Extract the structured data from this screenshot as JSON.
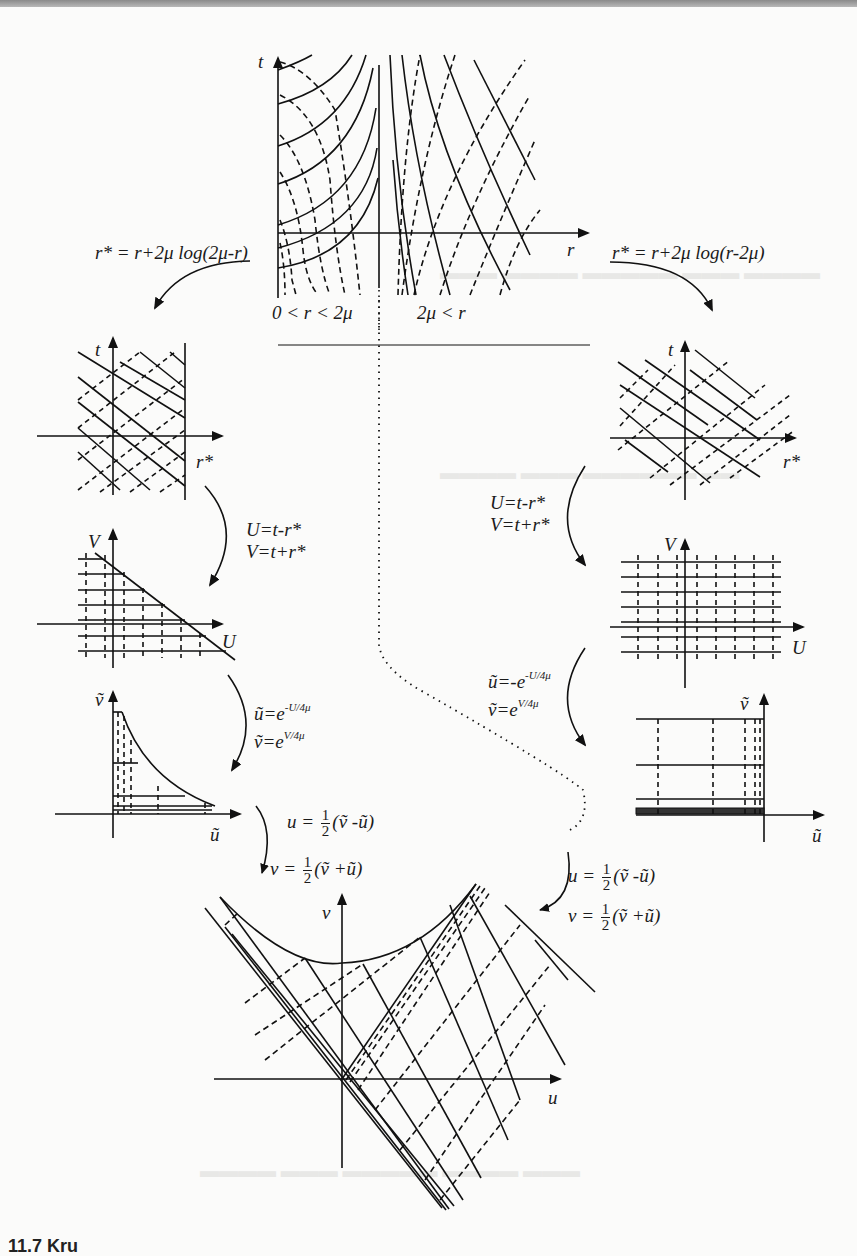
{
  "page": {
    "caption_partial": "11.7 Kru",
    "domain_note": "Scanned textbook figure: Kruskal–Szekeres coordinate construction"
  },
  "diagram": {
    "top_panel": {
      "axis_t": "t",
      "axis_r": "r",
      "region_left": "0 < r < 2μ",
      "region_right": "2μ < r"
    },
    "left_branch": {
      "tortoise": "r* = r+2μ log(2μ-r)",
      "panel1": {
        "axis_v": "t",
        "axis_h": "r*"
      },
      "step1": {
        "line1": "U=t-r*",
        "line2": "V=t+r*"
      },
      "panel2": {
        "axis_v": "V",
        "axis_h": "U"
      },
      "step2": {
        "line1_base": "ũ=e",
        "line1_exp": "-U/4μ",
        "line2_base": "ṽ=e",
        "line2_exp": "V/4μ"
      },
      "panel3": {
        "axis_v": "ṽ",
        "axis_h": "ũ"
      },
      "step3": {
        "u_lhs": "u = ",
        "v_lhs": "v = ",
        "frac_n": "1",
        "frac_d": "2",
        "u_rhs": "(ṽ -ũ)",
        "v_rhs": "(ṽ +ũ)"
      }
    },
    "right_branch": {
      "tortoise": "r* = r+2μ log(r-2μ)",
      "panel1": {
        "axis_v": "t",
        "axis_h": "r*"
      },
      "step1": {
        "line1": "U=t-r*",
        "line2": "V=t+r*"
      },
      "panel2": {
        "axis_v": "V",
        "axis_h": "U"
      },
      "step2": {
        "line1_base": "ũ=-e",
        "line1_exp": "-U/4μ",
        "line2_base": "ṽ=e",
        "line2_exp": "V/4μ"
      },
      "panel3": {
        "axis_v": "ṽ",
        "axis_h": "ũ"
      },
      "step3": {
        "u_lhs": "u = ",
        "v_lhs": "v = ",
        "frac_n": "1",
        "frac_d": "2",
        "u_rhs": "(ṽ -ũ)",
        "v_rhs": "(ṽ +ũ)"
      }
    },
    "bottom_panel": {
      "axis_v": "v",
      "axis_h": "u"
    }
  }
}
